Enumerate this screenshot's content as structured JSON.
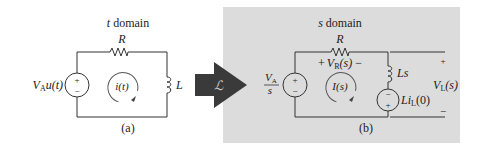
{
  "figure": {
    "panel_a": {
      "title": "t domain",
      "caption": "(a)",
      "resistor_label": "R",
      "inductor_label": "L",
      "source_label_main": "V",
      "source_label_sub": "A",
      "source_label_tail": "u(t)",
      "source_plus": "+",
      "source_minus": "−",
      "current_label": "i(t)"
    },
    "transform_arrow": {
      "symbol": "ℒ",
      "color": "#3a3a3a"
    },
    "panel_b": {
      "title": "s domain",
      "caption": "(b)",
      "background": "#dcdcdc",
      "resistor_label": "R",
      "vr_label_plus": "+",
      "vr_label_main": "V",
      "vr_label_sub": "R",
      "vr_label_tail": "(s)",
      "vr_label_minus": "−",
      "source_num_main": "V",
      "source_num_sub": "A",
      "source_den": "s",
      "source_plus": "+",
      "source_minus": "−",
      "current_label": "I(s)",
      "inductor_label": "Ls",
      "ic_source_label_main": "Li",
      "ic_source_label_sub": "L",
      "ic_source_label_tail": "(0)",
      "ic_source_top": "−",
      "ic_source_bottom": "+",
      "output_plus": "+",
      "output_minus": "−",
      "output_label_main": "V",
      "output_label_sub": "L",
      "output_label_tail": "(s)"
    }
  }
}
